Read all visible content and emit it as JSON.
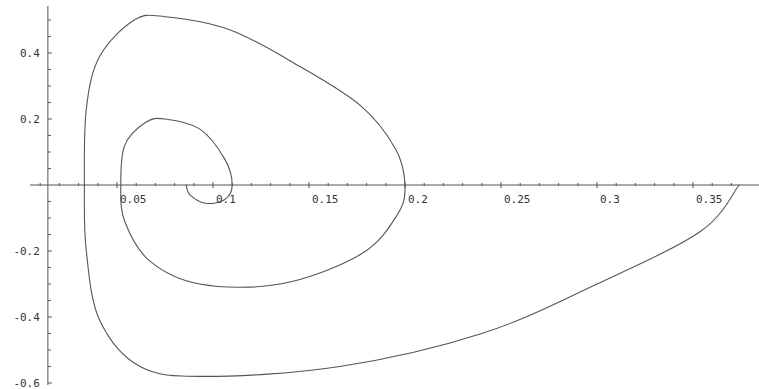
{
  "chart_data": {
    "type": "line",
    "title": "",
    "xlabel": "",
    "ylabel": "",
    "xlim": [
      0.0,
      0.38
    ],
    "ylim": [
      -0.6,
      0.52
    ],
    "axes_origin": [
      0.014,
      0
    ],
    "grid": false,
    "legend": null,
    "line_color": "#555555",
    "x_ticks": [
      {
        "value": 0.05,
        "label": "0.05"
      },
      {
        "value": 0.1,
        "label": "0.1"
      },
      {
        "value": 0.15,
        "label": "0.15"
      },
      {
        "value": 0.2,
        "label": "0.2"
      },
      {
        "value": 0.25,
        "label": "0.25"
      },
      {
        "value": 0.3,
        "label": "0.3"
      },
      {
        "value": 0.35,
        "label": "0.35"
      }
    ],
    "y_ticks": [
      {
        "value": 0.4,
        "label": "0.4"
      },
      {
        "value": 0.2,
        "label": "0.2"
      },
      {
        "value": -0.2,
        "label": "-0.2"
      },
      {
        "value": -0.4,
        "label": "-0.4"
      },
      {
        "value": -0.6,
        "label": "-0.6"
      }
    ],
    "series": [
      {
        "name": "trajectory (inward spiral)",
        "points": [
          [
            0.374,
            0.0
          ],
          [
            0.354,
            -0.14
          ],
          [
            0.3,
            -0.3
          ],
          [
            0.24,
            -0.45
          ],
          [
            0.166,
            -0.55
          ],
          [
            0.096,
            -0.58
          ],
          [
            0.062,
            -0.55
          ],
          [
            0.041,
            -0.41
          ],
          [
            0.034,
            -0.2
          ],
          [
            0.033,
            0.0
          ],
          [
            0.034,
            0.23
          ],
          [
            0.041,
            0.39
          ],
          [
            0.059,
            0.5
          ],
          [
            0.075,
            0.51
          ],
          [
            0.109,
            0.47
          ],
          [
            0.145,
            0.36
          ],
          [
            0.177,
            0.24
          ],
          [
            0.195,
            0.11
          ],
          [
            0.2,
            0.0
          ],
          [
            0.196,
            -0.09
          ],
          [
            0.177,
            -0.21
          ],
          [
            0.135,
            -0.3
          ],
          [
            0.093,
            -0.3
          ],
          [
            0.067,
            -0.23
          ],
          [
            0.054,
            -0.11
          ],
          [
            0.052,
            0.0
          ],
          [
            0.054,
            0.12
          ],
          [
            0.065,
            0.19
          ],
          [
            0.075,
            0.2
          ],
          [
            0.093,
            0.17
          ],
          [
            0.106,
            0.08
          ],
          [
            0.11,
            0.0
          ],
          [
            0.106,
            -0.045
          ],
          [
            0.096,
            -0.055
          ],
          [
            0.088,
            -0.03
          ],
          [
            0.086,
            0.0
          ]
        ]
      }
    ]
  }
}
